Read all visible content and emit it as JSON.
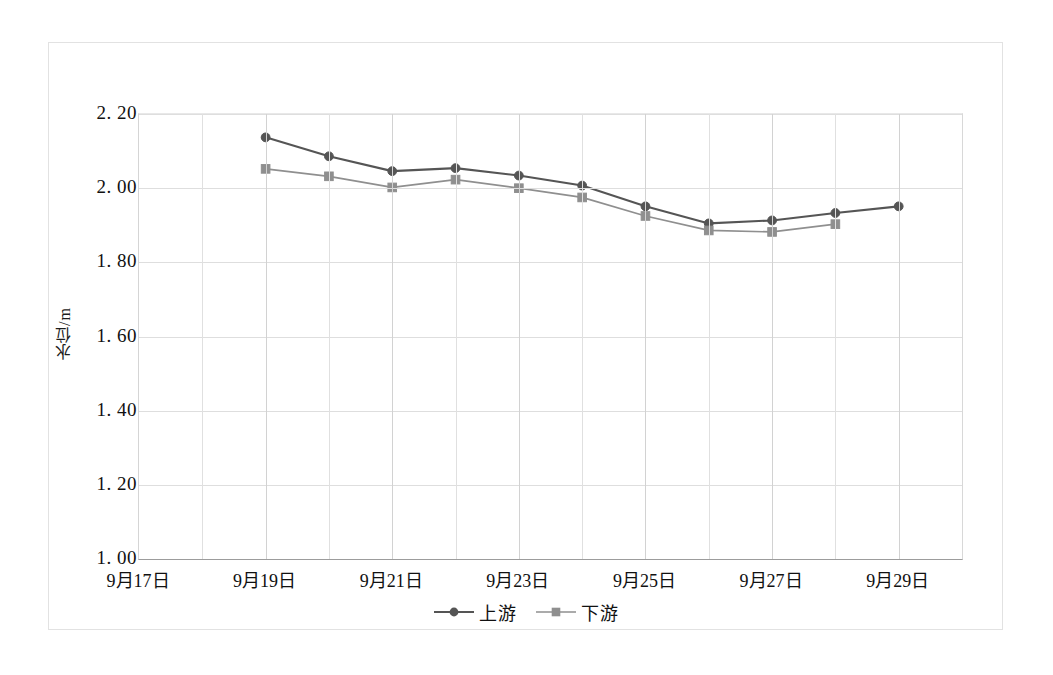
{
  "chart_data": {
    "type": "line",
    "title": "",
    "xlabel": "",
    "ylabel": "水位/m",
    "ylim": [
      1.0,
      2.2
    ],
    "ytick_labels": [
      "2. 20",
      "2. 00",
      "1. 80",
      "1. 60",
      "1. 40",
      "1. 20",
      "1. 00"
    ],
    "ytick_values": [
      2.2,
      2.0,
      1.8,
      1.6,
      1.4,
      1.2,
      1.0
    ],
    "xtick_labels": [
      "9月17日",
      "9月19日",
      "9月21日",
      "9月23日",
      "9月25日",
      "9月27日",
      "9月29日"
    ],
    "xtick_values": [
      17,
      19,
      21,
      23,
      25,
      27,
      29
    ],
    "x_minor_count": 11,
    "grid": "both",
    "legend_position": "bottom-center",
    "x": [
      19,
      20,
      21,
      22,
      23,
      24,
      25,
      26,
      27,
      28,
      29
    ],
    "series": [
      {
        "name": "上游",
        "marker": "circle",
        "color": "#555555",
        "values": [
          2.137,
          2.086,
          2.046,
          2.054,
          2.034,
          2.007,
          1.951,
          1.905,
          1.913,
          1.933,
          1.951
        ]
      },
      {
        "name": "下游",
        "marker": "square",
        "color": "#8f8f8f",
        "values": [
          2.052,
          2.032,
          2.002,
          2.023,
          2.0,
          1.975,
          1.925,
          1.886,
          1.882,
          1.903,
          null
        ]
      }
    ]
  },
  "legend": {
    "items": [
      {
        "label": "上游"
      },
      {
        "label": "下游"
      }
    ]
  },
  "colors": {
    "upstream": "#555555",
    "downstream": "#8f8f8f",
    "grid": "#dedede",
    "axis": "#9c9c9c",
    "frame": "#e2e2e2",
    "text": "#111111"
  }
}
